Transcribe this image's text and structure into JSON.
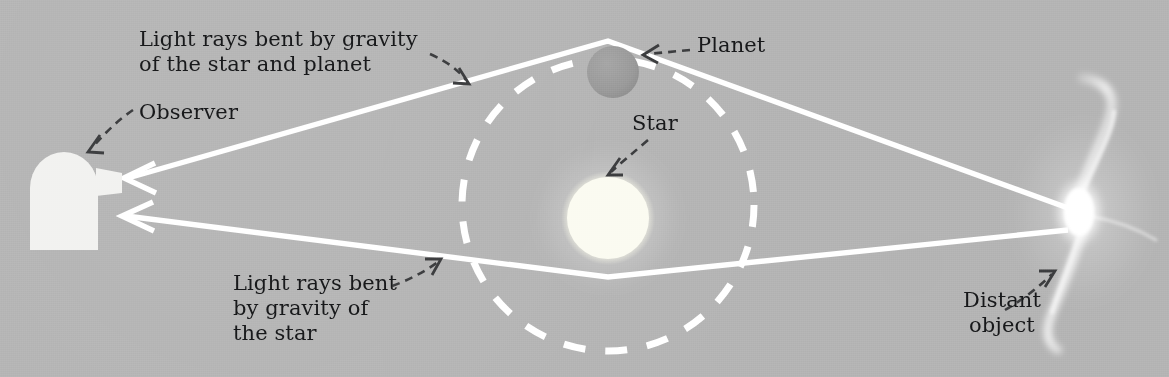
{
  "figure": {
    "background_color": "#b5b5b5",
    "ink_color": "#ffffff",
    "text_color": "#17181a"
  },
  "labels": {
    "rays_top": "Light rays bent by gravity\nof the star and planet",
    "observer": "Observer",
    "planet": "Planet",
    "star": "Star",
    "rays_bottom": "Light rays bent\nby gravity of\nthe star",
    "distant_object": "Distant\nobject"
  },
  "objects": {
    "observer": {
      "name": "Observer",
      "kind": "observatory-dome",
      "color": "#f2f2f0"
    },
    "star": {
      "name": "Star",
      "kind": "glowing-disc",
      "color": "#fbfbf2",
      "radius_px": 46
    },
    "planet": {
      "name": "Planet",
      "kind": "shaded-disc",
      "color": "#9a9a9a",
      "radius_px": 26
    },
    "distant_object": {
      "name": "Distant object",
      "kind": "spiral-galaxy",
      "color": "#ffffff"
    },
    "orbit": {
      "name": "Planet orbit",
      "kind": "dashed-circle",
      "color": "#ffffff",
      "radius_px": 146
    }
  },
  "light_rays": [
    {
      "name": "upper-ray",
      "bent_by": "star and planet",
      "direction": "toward observer",
      "arrowhead": "left"
    },
    {
      "name": "lower-ray",
      "bent_by": "star",
      "direction": "toward observer",
      "arrowhead": "left"
    }
  ]
}
